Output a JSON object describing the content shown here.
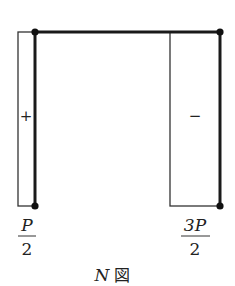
{
  "diagram": {
    "title_variable": "N",
    "title_suffix": "図",
    "left_member": {
      "sign": "+",
      "value_label": {
        "numerator": "P",
        "denominator": "2"
      }
    },
    "right_member": {
      "sign": "−",
      "value_label": {
        "numerator": "3P",
        "denominator": "2"
      }
    },
    "colors": {
      "line": "#1a1a1a",
      "background": "#ffffff"
    }
  }
}
